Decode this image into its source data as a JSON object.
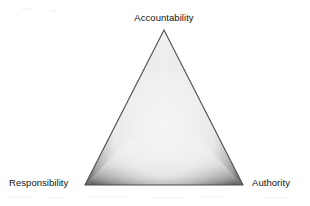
{
  "figure": {
    "type": "triangle-diagram",
    "background_color": "#ffffff",
    "shape": {
      "name": "equilateral-triangle",
      "apex": [
        164,
        30
      ],
      "bottom_left": [
        85,
        185
      ],
      "bottom_right": [
        243,
        185
      ],
      "edge_color": "#5a5a5a",
      "interior_color": "#efefef",
      "mid_shade_color": "#b4b4b4",
      "style": "embossed-gradient"
    },
    "vertices": [
      {
        "id": "accountability",
        "label": "Accountability",
        "position": "top"
      },
      {
        "id": "responsibility",
        "label": "Responsibility",
        "position": "bottom-left"
      },
      {
        "id": "authority",
        "label": "Authority",
        "position": "bottom-right"
      }
    ]
  }
}
